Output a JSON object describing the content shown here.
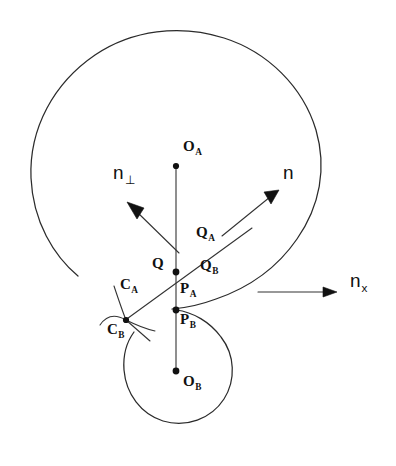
{
  "figure": {
    "background_color": "#ffffff",
    "ink_color": "#2b2b2b",
    "width": 396,
    "height": 466
  },
  "labels": {
    "center_a": {
      "text": "O",
      "sub": "A",
      "x": 183,
      "y": 146
    },
    "center_b": {
      "text": "O",
      "sub": "B",
      "x": 183,
      "y": 381
    },
    "point_q": {
      "text": "Q",
      "sub": "",
      "x": 152,
      "y": 262
    },
    "point_qa": {
      "text": "Q",
      "sub": "A",
      "x": 196,
      "y": 231
    },
    "point_qb": {
      "text": "Q",
      "sub": "B",
      "x": 200,
      "y": 264
    },
    "point_pa": {
      "text": "P",
      "sub": "A",
      "x": 180,
      "y": 287
    },
    "point_pb": {
      "text": "P",
      "sub": "B",
      "x": 180,
      "y": 318
    },
    "curve_ca": {
      "text": "C",
      "sub": "A",
      "x": 120,
      "y": 283
    },
    "curve_cb": {
      "text": "C",
      "sub": "B",
      "x": 107,
      "y": 328
    },
    "normal_perp": {
      "text": "n",
      "sub": "⊥",
      "x": 113,
      "y": 170
    },
    "normal_n": {
      "text": "n",
      "sub": "",
      "x": 283,
      "y": 170
    },
    "normal_nx": {
      "text": "n",
      "sub": "x",
      "x": 350,
      "y": 278
    }
  },
  "geometry": {
    "circle_a": {
      "name": "large-circle",
      "cx": 176,
      "cy": 166,
      "r": 145,
      "arc_gap": true
    },
    "circle_b": {
      "name": "small-circle",
      "cx": 176,
      "cy": 371,
      "r": 52,
      "arc_gap": true
    },
    "center_line": {
      "name": "center-to-center-line",
      "x1": 176,
      "y1": 166,
      "x2": 176,
      "y2": 371
    },
    "tangent_line": {
      "name": "common-tangent-line",
      "x1": 126,
      "y1": 320,
      "x2": 252,
      "y2": 228
    },
    "dots": [
      {
        "name": "dot-oa",
        "cx": 176,
        "cy": 166,
        "r": 3.1
      },
      {
        "name": "dot-q",
        "cx": 176,
        "cy": 272,
        "r": 3.4
      },
      {
        "name": "dot-p",
        "cx": 176,
        "cy": 310,
        "r": 3.4
      },
      {
        "name": "dot-ob",
        "cx": 176,
        "cy": 371,
        "r": 3.4
      },
      {
        "name": "dot-cb-junction",
        "cx": 126,
        "cy": 320,
        "r": 3.1
      }
    ],
    "arrows": [
      {
        "name": "arrow-n-perp",
        "x1": 178,
        "y1": 252,
        "x2": 128,
        "y2": 203
      },
      {
        "name": "arrow-n",
        "x1": 222,
        "y1": 236,
        "x2": 278,
        "y2": 191
      },
      {
        "name": "arrow-nx",
        "x1": 258,
        "y1": 292,
        "x2": 336,
        "y2": 292
      }
    ]
  }
}
